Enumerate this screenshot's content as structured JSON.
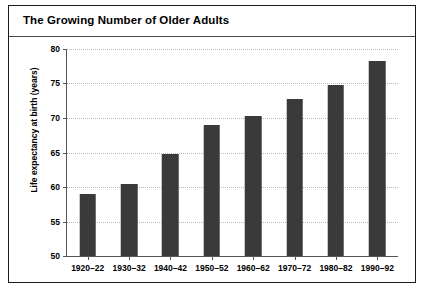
{
  "figure": {
    "title": "The Growing Number of Older Adults",
    "border_color": "#1a1a1a",
    "background": "#ffffff"
  },
  "chart_data": {
    "type": "bar",
    "title": "The Growing Number of Older Adults",
    "xlabel": "",
    "ylabel": "Life expectancy at birth (years)",
    "categories": [
      "1920–22",
      "1930–32",
      "1940–42",
      "1950–52",
      "1960–62",
      "1970–72",
      "1980–82",
      "1990–92"
    ],
    "values": [
      59.0,
      60.5,
      64.8,
      69.0,
      70.3,
      72.8,
      74.8,
      78.3
    ],
    "ylim": [
      50,
      80
    ],
    "yticks": [
      50,
      55,
      60,
      65,
      70,
      75,
      80
    ],
    "ytick_labels": [
      "50",
      "55",
      "60",
      "65",
      "70",
      "75",
      "80"
    ],
    "bar_color": "#3a3a3a",
    "grid": true,
    "grid_style": "dotted",
    "grid_color": "#b9b9b9",
    "legend": "none"
  }
}
